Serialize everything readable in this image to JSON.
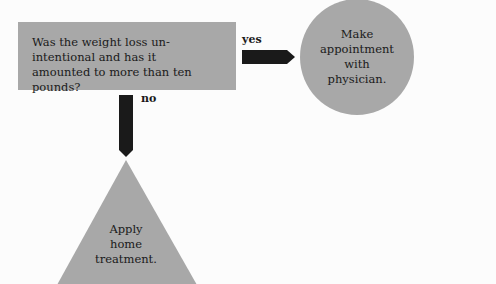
{
  "decision": {
    "lines": [
      "Was the weight loss un-",
      "intentional and has it",
      "amounted to more than ten pounds?"
    ]
  },
  "yes_branch": {
    "label": "yes",
    "outcome_lines": [
      "Make",
      "appointment",
      "with",
      "physician."
    ]
  },
  "no_branch": {
    "label": "no",
    "outcome_lines": [
      "Apply",
      "home",
      "treatment."
    ]
  },
  "colors": {
    "shape_fill": "#a8a8a8",
    "arrow": "#1a1a1a",
    "background": "#fcfcfc"
  }
}
